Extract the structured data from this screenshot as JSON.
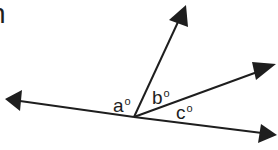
{
  "diagram": {
    "type": "angles-at-a-point",
    "cropped_text": "n",
    "vertex": {
      "x": 134,
      "y": 117
    },
    "stroke_color": "#1e1e1e",
    "rays": [
      {
        "name": "left",
        "tip": {
          "x": 6,
          "y": 99
        }
      },
      {
        "name": "up",
        "tip": {
          "x": 186,
          "y": 5
        }
      },
      {
        "name": "upper-right",
        "tip": {
          "x": 276,
          "y": 65
        }
      },
      {
        "name": "lower-right",
        "tip": {
          "x": 277,
          "y": 135
        }
      }
    ],
    "angles": [
      {
        "id": "a",
        "label": "a",
        "degree_symbol": "o"
      },
      {
        "id": "b",
        "label": "b",
        "degree_symbol": "o"
      },
      {
        "id": "c",
        "label": "c",
        "degree_symbol": "o"
      }
    ]
  }
}
